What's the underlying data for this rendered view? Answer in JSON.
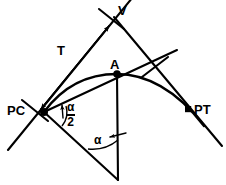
{
  "diagram": {
    "stroke_color": "#000000",
    "background_color": "#ffffff",
    "labels": {
      "pc": "PC",
      "pt": "PT",
      "vertex": "V",
      "midpoint": "A",
      "tangent_length": "T",
      "alpha_numerator": "α",
      "alpha_denominator": "2",
      "alpha_full": "α"
    },
    "points": {
      "pc": {
        "x": 44,
        "y": 112,
        "marker": "filled-dot"
      },
      "vertex": {
        "x": 115,
        "y": 18,
        "marker": "none"
      },
      "midpoint": {
        "x": 117,
        "y": 74,
        "marker": "filled-dot"
      },
      "pt": {
        "x": 188,
        "y": 110,
        "marker": "filled-square"
      },
      "apex_bottom": {
        "x": 118,
        "y": 180,
        "marker": "none"
      }
    },
    "segments": {
      "back_tangent": {
        "from": [
          8,
          150
        ],
        "to": [
          137,
          -8
        ],
        "name": "back-tangent-through-pc-and-v"
      },
      "forward_tangent": {
        "from": [
          115,
          18
        ],
        "to": [
          222,
          146
        ],
        "name": "forward-tangent-through-v-and-pt"
      },
      "long_chord_extended": {
        "from": [
          44,
          112
        ],
        "to": [
          177,
          50
        ],
        "name": "chord-pc-to-a-extended"
      },
      "vertical_ordinate": {
        "from": [
          117,
          74
        ],
        "to": [
          118,
          180
        ],
        "name": "vertical-line-a-to-apex"
      },
      "lower_ray": {
        "from": [
          44,
          112
        ],
        "to": [
          118,
          180
        ],
        "name": "lower-ray-pc-to-apex"
      },
      "tangent_dimension": {
        "from": [
          39,
          107
        ],
        "to": [
          110,
          13
        ],
        "name": "tangent-length-dimension-arrow"
      },
      "tick_at_v": {
        "from": [
          100,
          10
        ],
        "to": [
          124,
          28
        ],
        "name": "tick-mark-near-vertex"
      },
      "tick_at_pc": {
        "from": [
          23,
          101
        ],
        "to": [
          47,
          120
        ],
        "name": "tick-mark-near-pc"
      }
    },
    "curve": {
      "name": "circular-curve-pc-a-pt",
      "path": "M 44 112 C 68 80, 96 74, 117 74 C 146 74, 176 88, 203 124"
    },
    "angles": [
      {
        "name": "alpha-over-two-at-pc",
        "label": "α/2",
        "vertex": [
          44,
          112
        ]
      },
      {
        "name": "alpha-at-bottom-apex",
        "label": "α",
        "vertex": [
          118,
          180
        ]
      }
    ]
  }
}
